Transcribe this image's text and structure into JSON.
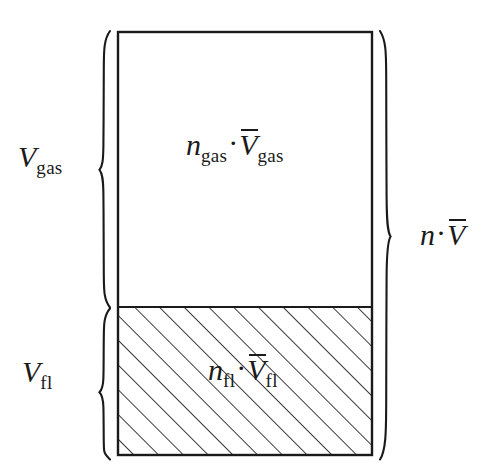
{
  "figure": {
    "type": "thermodynamic-volume-additivity-diagram",
    "background_color": "#ffffff",
    "line_color": "#1a1a1a"
  },
  "container": {
    "gas_region": {
      "name": "gas-phase-region",
      "fill": "none"
    },
    "fluid_region": {
      "name": "fluid-phase-region",
      "fill": "diagonal-hatching"
    }
  },
  "labels": {
    "left_gas": {
      "symbol": "V",
      "subscript": "gas"
    },
    "left_fluid": {
      "symbol": "V",
      "subscript": "fl"
    },
    "gas_interior": {
      "factor_symbol": "n",
      "factor_subscript": "gas",
      "operator": "·",
      "molar_symbol": "V",
      "molar_subscript": "gas"
    },
    "fluid_interior": {
      "factor_symbol": "n",
      "factor_subscript": "fl",
      "operator": "·",
      "molar_symbol": "V",
      "molar_subscript": "fl"
    },
    "right_total": {
      "factor_symbol": "n",
      "operator": "·",
      "molar_symbol": "V"
    }
  },
  "braces": {
    "left_gas_brace": "brace-left-gas",
    "left_fluid_brace": "brace-left-fluid",
    "right_total_brace": "brace-right-total"
  }
}
